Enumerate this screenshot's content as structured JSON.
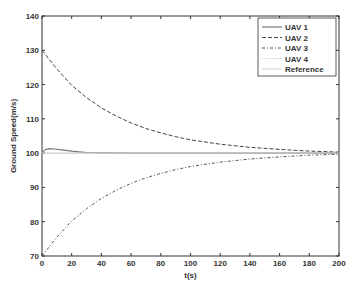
{
  "chart_data": {
    "type": "line",
    "title": "",
    "xlabel": "t(s)",
    "ylabel": "Ground Speed(m/s)",
    "xlim": [
      0,
      200
    ],
    "ylim": [
      70,
      140
    ],
    "xticks": [
      0,
      20,
      40,
      60,
      80,
      100,
      120,
      140,
      160,
      180,
      200
    ],
    "yticks": [
      70,
      80,
      90,
      100,
      110,
      120,
      130,
      140
    ],
    "grid": false,
    "legend_position": "upper right",
    "series": [
      {
        "name": "UAV 1",
        "style": "solid",
        "x": [
          0,
          2,
          5,
          8,
          12,
          16,
          20,
          25,
          30,
          40,
          60,
          200
        ],
        "values": [
          100,
          101,
          101.3,
          101.2,
          101,
          100.8,
          100.6,
          100.4,
          100.2,
          100.1,
          100,
          100
        ]
      },
      {
        "name": "UAV 2",
        "style": "dashed",
        "x": [
          0,
          10,
          20,
          30,
          40,
          50,
          60,
          70,
          80,
          90,
          100,
          120,
          140,
          160,
          180,
          200
        ],
        "values": [
          130,
          124.5,
          119.8,
          116.2,
          113.2,
          110.8,
          108.8,
          107.2,
          105.9,
          104.8,
          103.9,
          102.6,
          101.7,
          101.1,
          100.6,
          100.3
        ]
      },
      {
        "name": "UAV 3",
        "style": "dashdot",
        "x": [
          0,
          10,
          20,
          30,
          40,
          50,
          60,
          70,
          80,
          90,
          100,
          120,
          140,
          160,
          180,
          200
        ],
        "values": [
          70,
          75.5,
          80.2,
          83.8,
          86.8,
          89.2,
          91.2,
          92.8,
          94.1,
          95.2,
          96.1,
          97.4,
          98.3,
          98.9,
          99.4,
          99.7
        ]
      },
      {
        "name": "UAV 4",
        "style": "dotted",
        "x": [
          0,
          200
        ],
        "values": [
          100,
          100
        ]
      },
      {
        "name": "Reference",
        "style": "solid-light",
        "x": [
          0,
          200
        ],
        "values": [
          100,
          100
        ]
      }
    ]
  }
}
